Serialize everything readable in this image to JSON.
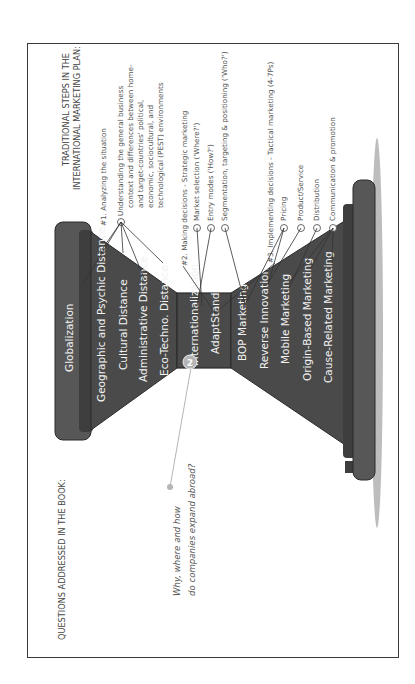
{
  "header": {
    "questions_title": "QUESTIONS ADDRESSED IN THE BOOK:",
    "steps_title_line1": "TRADITIONAL STEPS IN THE",
    "steps_title_line2": "INTERNATIONAL MARKETING PLAN:"
  },
  "question": {
    "badge_number": "2",
    "line1": "Why, where and how",
    "line2": "do companies expand abroad?"
  },
  "hourglass": {
    "top_cap": "Globalization",
    "upper_section": [
      "Geographic and Psychic Distance",
      "Cultural Distance",
      "Administrative Distance",
      "Eco-Techno. Distance"
    ],
    "waist": [
      "Internationalization",
      "AdaptStand"
    ],
    "lower_section": [
      "BOP Marketing",
      "Reverse Innovation",
      "Mobile Marketing",
      "Origin-Based Marketing",
      "Cause-Related Marketing"
    ],
    "colors": {
      "body": "#4a4a4a",
      "cap": "#555555",
      "edge": "#2b2b2b",
      "shadow": "#bdbdbd",
      "badge": "#b5b5b5"
    }
  },
  "steps": [
    {
      "title": "#1. Analyzing the situation",
      "items": [
        {
          "lines": [
            "Understanding the general business",
            "context and differences between home-",
            "and target-countries' political,",
            "economic, sociocultural, and",
            "technological (PEST) environments"
          ]
        }
      ]
    },
    {
      "title": "#2. Making decisions - Strategic marketing",
      "items": [
        {
          "lines": [
            "Market selection ('Where?')"
          ]
        },
        {
          "lines": [
            "Entry modes ('How?')"
          ]
        },
        {
          "lines": [
            "Segmentation, targeting & positioning ('Who?')"
          ]
        }
      ]
    },
    {
      "title": "#3. Implementing decisions - Tactical marketing (4-7Ps)",
      "items": [
        {
          "lines": [
            "Pricing"
          ]
        },
        {
          "lines": [
            "Product/Service"
          ]
        },
        {
          "lines": [
            "Distribution"
          ]
        },
        {
          "lines": [
            "Communication & promotion"
          ]
        }
      ]
    }
  ]
}
